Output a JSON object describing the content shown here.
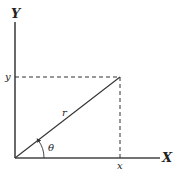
{
  "diagram": {
    "type": "polar-cartesian-coordinates",
    "axes": {
      "x_label": "X",
      "y_label": "Y"
    },
    "point_labels": {
      "x_projection": "x",
      "y_projection": "y"
    },
    "vector_label": "r",
    "angle_label": "θ",
    "colors": {
      "line": "#333333",
      "background": "#ffffff"
    }
  }
}
